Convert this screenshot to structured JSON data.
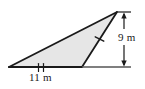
{
  "figure": {
    "type": "geometry-diagram",
    "shape": "triangle",
    "background_color": "#ffffff",
    "fill_color": "#e6e6e6",
    "stroke_color": "#1a1a1a",
    "labels": {
      "base": {
        "text": "11 m",
        "value": 11,
        "unit": "m",
        "position": "below-base",
        "tick_marks": 2
      },
      "height": {
        "text": "9 m",
        "value": 9,
        "unit": "m",
        "position": "right-side",
        "dimension_line": "vertical-double-arrow"
      }
    },
    "side_marks": {
      "right_side_ticks": 1
    },
    "geometry": {
      "vertices": {
        "left": [
          9,
          67
        ],
        "apex": [
          117,
          12
        ],
        "bottom_right": [
          82,
          67
        ]
      },
      "baseline_extension_end": [
        131,
        67
      ],
      "dimension_line_x": 124,
      "dimension_line_top_y": 12,
      "dimension_line_bottom_y": 67
    }
  }
}
